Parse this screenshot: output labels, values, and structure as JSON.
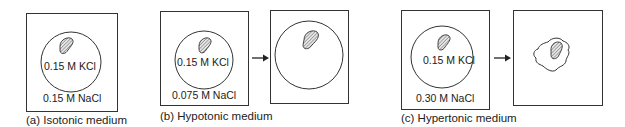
{
  "figure": {
    "panels": [
      {
        "id": "a",
        "caption": "(a) Isotonic medium",
        "inside_label": "0.15 M KCl",
        "outside_label": "0.15 M NaCl",
        "result": null
      },
      {
        "id": "b",
        "caption": "(b) Hypotonic medium",
        "inside_label": "0.15 M KCl",
        "outside_label": "0.075 M NaCl",
        "result": "swollen-cell"
      },
      {
        "id": "c",
        "caption": "(c) Hypertonic medium",
        "inside_label": "0.15 M KCl",
        "outside_label": "0.30 M NaCl",
        "result": "shrunken-cell"
      }
    ],
    "icons": {
      "arrow": "right-arrow",
      "nucleus": "hatched-nucleus"
    },
    "colors": {
      "stroke": "#333333",
      "nucleus_fill": "#bdbdbd",
      "background": "#ffffff"
    }
  }
}
